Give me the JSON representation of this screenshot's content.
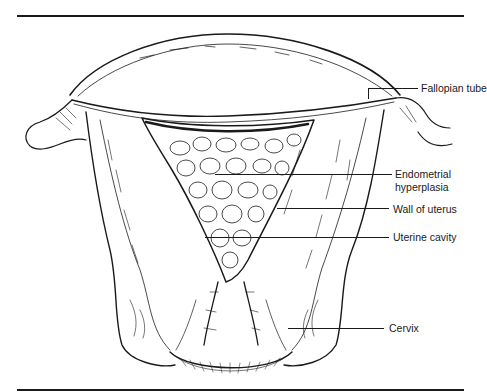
{
  "figure": {
    "stroke_color": "#1a1a1a",
    "background": "#ffffff"
  },
  "labels": {
    "fallopian_tube": "Fallopian tube",
    "endometrial_hyperplasia_line1": "Endometrial",
    "endometrial_hyperplasia_line2": "hyperplasia",
    "wall_of_uterus": "Wall of uterus",
    "uterine_cavity": "Uterine cavity",
    "cervix": "Cervix"
  }
}
